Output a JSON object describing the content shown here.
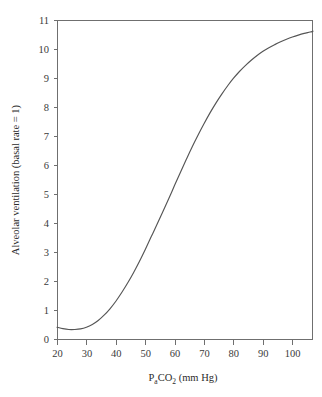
{
  "figure": {
    "background_color": "#ffffff",
    "axis_color": "#6f6f6f",
    "curve_color": "#555555",
    "text_color": "#2b2b2b"
  },
  "axis_titles": {
    "x_prefix": "P",
    "x_sub_a": "a",
    "x_mid": "CO",
    "x_sub_2": "2",
    "x_suffix": " (mm Hg)",
    "x_full": "PaCO2 (mm Hg)",
    "y_full": "Alveolar ventilation (basal rate = 1)"
  },
  "chart_data": {
    "type": "line",
    "title": "",
    "subtitle": "",
    "xlabel": "PaCO2 (mm Hg)",
    "ylabel": "Alveolar ventilation (basal rate = 1)",
    "xlim": [
      20,
      107
    ],
    "ylim": [
      0,
      11.4
    ],
    "grid": false,
    "legend": null,
    "xticks": [
      20,
      30,
      40,
      50,
      60,
      70,
      80,
      90,
      100
    ],
    "xtick_labels": [
      "20",
      "30",
      "40",
      "50",
      "60",
      "70",
      "80",
      "90",
      "100"
    ],
    "yticks": [
      0,
      1,
      2,
      3,
      4,
      5,
      6,
      7,
      8,
      9,
      10,
      11
    ],
    "ytick_labels": [
      "0",
      "1",
      "2",
      "3",
      "4",
      "5",
      "6",
      "7",
      "8",
      "9",
      "10",
      "11"
    ],
    "series": [
      {
        "name": "Alveolar ventilation response",
        "x": [
          20,
          22,
          24,
          26,
          28,
          30,
          32,
          34,
          36,
          38,
          40,
          42,
          44,
          46,
          48,
          50,
          52,
          54,
          56,
          58,
          60,
          62,
          64,
          66,
          68,
          70,
          72,
          74,
          76,
          78,
          80,
          82,
          84,
          86,
          88,
          90,
          92,
          94,
          96,
          98,
          100,
          102,
          104,
          106,
          107
        ],
        "y": [
          0.42,
          0.37,
          0.34,
          0.34,
          0.36,
          0.42,
          0.52,
          0.66,
          0.85,
          1.08,
          1.35,
          1.66,
          2.0,
          2.37,
          2.77,
          3.2,
          3.65,
          4.1,
          4.56,
          5.02,
          5.5,
          5.97,
          6.43,
          6.88,
          7.3,
          7.7,
          8.08,
          8.43,
          8.75,
          9.05,
          9.32,
          9.56,
          9.77,
          9.96,
          10.13,
          10.28,
          10.41,
          10.52,
          10.62,
          10.71,
          10.79,
          10.86,
          10.92,
          10.97,
          11.0
        ]
      }
    ]
  },
  "plot_geometry": {
    "left": 57,
    "right": 313,
    "top": 20,
    "bottom": 339
  }
}
